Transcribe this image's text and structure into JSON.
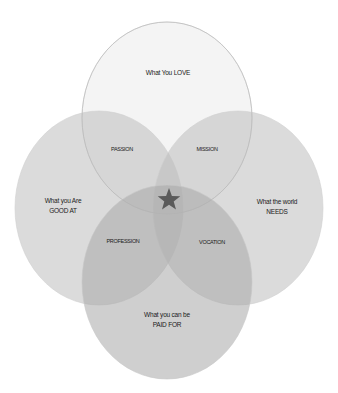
{
  "diagram": {
    "type": "venn-4-ellipses",
    "circles": [
      {
        "id": "love",
        "label_line1": "What You LOVE",
        "label_line2": "",
        "cx": 167,
        "cy": 118,
        "rx": 85,
        "ry": 96,
        "fill": "#f2f2f2",
        "opacity": 0.55,
        "stroke": "#c8c8c8"
      },
      {
        "id": "good-at",
        "label_line1": "What you Are",
        "label_line2": "GOOD AT",
        "cx": 99,
        "cy": 208,
        "rx": 84,
        "ry": 97,
        "fill": "#c9c9c9",
        "opacity": 0.55,
        "stroke": "#d8d8d8"
      },
      {
        "id": "world-needs",
        "label_line1": "What the world",
        "label_line2": "NEEDS",
        "cx": 238,
        "cy": 208,
        "rx": 85,
        "ry": 97,
        "fill": "#c9c9c9",
        "opacity": 0.55,
        "stroke": "#d8d8d8"
      },
      {
        "id": "paid-for",
        "label_line1": "What you can be",
        "label_line2": "PAID FOR",
        "cx": 167,
        "cy": 282,
        "rx": 85,
        "ry": 97,
        "fill": "#b9b9b9",
        "opacity": 0.55,
        "stroke": "#cfcfcf"
      }
    ],
    "intersections": {
      "passion": "PASSION",
      "mission": "MISSION",
      "profession": "PROFESSION",
      "vocation": "VOCATION"
    },
    "center": {
      "symbol": "★",
      "color": "#5a5a5a"
    }
  }
}
